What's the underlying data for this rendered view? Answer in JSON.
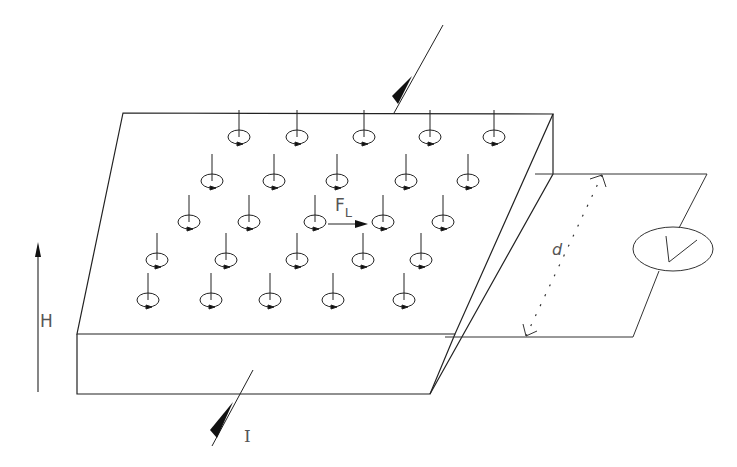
{
  "diagram": {
    "type": "flux-flow schematic",
    "labels": {
      "magnetic_field": "H",
      "current": "I",
      "lorentz_force": "F",
      "lorentz_force_sub": "L",
      "distance": "d",
      "voltmeter": "V"
    },
    "colors": {
      "stroke": "#222222",
      "background": "#ffffff"
    },
    "slab": {
      "top_face": [
        [
          123,
          113
        ],
        [
          553,
          114
        ],
        [
          455,
          334
        ],
        [
          77,
          334
        ]
      ],
      "thickness_px": 60
    },
    "vortex_rows": [
      {
        "y": 137,
        "x": [
          239,
          297,
          364,
          430,
          494
        ]
      },
      {
        "y": 181,
        "x": [
          212,
          274,
          337,
          406,
          468
        ]
      },
      {
        "y": 222,
        "x": [
          189,
          249,
          315,
          383,
          443
        ]
      },
      {
        "y": 260,
        "x": [
          157,
          226,
          297,
          363,
          421
        ]
      },
      {
        "y": 300,
        "x": [
          148,
          211,
          270,
          333,
          404
        ]
      }
    ]
  }
}
